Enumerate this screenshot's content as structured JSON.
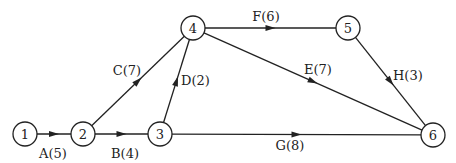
{
  "colors": {
    "stroke": "#222222",
    "background": "#ffffff"
  },
  "nodes": [
    {
      "id": "1",
      "label": "1",
      "x": 25,
      "y": 134
    },
    {
      "id": "2",
      "label": "2",
      "x": 83,
      "y": 134
    },
    {
      "id": "3",
      "label": "3",
      "x": 160,
      "y": 134
    },
    {
      "id": "4",
      "label": "4",
      "x": 193,
      "y": 28
    },
    {
      "id": "5",
      "label": "5",
      "x": 348,
      "y": 28
    },
    {
      "id": "6",
      "label": "6",
      "x": 433,
      "y": 135
    }
  ],
  "edges": [
    {
      "from": "1",
      "to": "2",
      "label": "A(5)",
      "activity": "A",
      "duration": 5,
      "lx": 53,
      "ly": 158,
      "anchor": "middle"
    },
    {
      "from": "2",
      "to": "3",
      "label": "B(4)",
      "activity": "B",
      "duration": 4,
      "lx": 125,
      "ly": 158,
      "anchor": "middle"
    },
    {
      "from": "2",
      "to": "4",
      "label": "C(7)",
      "activity": "C",
      "duration": 7,
      "lx": 127,
      "ly": 75,
      "anchor": "middle"
    },
    {
      "from": "3",
      "to": "4",
      "label": "D(2)",
      "activity": "D",
      "duration": 2,
      "lx": 181,
      "ly": 85,
      "anchor": "start"
    },
    {
      "from": "4",
      "to": "6",
      "label": "E(7)",
      "activity": "E",
      "duration": 7,
      "lx": 304,
      "ly": 74,
      "anchor": "start"
    },
    {
      "from": "4",
      "to": "5",
      "label": "F(6)",
      "activity": "F",
      "duration": 6,
      "lx": 266,
      "ly": 21,
      "anchor": "middle"
    },
    {
      "from": "3",
      "to": "6",
      "label": "G(8)",
      "activity": "G",
      "duration": 8,
      "lx": 290,
      "ly": 150,
      "anchor": "middle"
    },
    {
      "from": "5",
      "to": "6",
      "label": "H(3)",
      "activity": "H",
      "duration": 3,
      "lx": 393,
      "ly": 80,
      "anchor": "start"
    }
  ]
}
